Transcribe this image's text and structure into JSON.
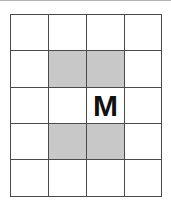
{
  "diagram": {
    "rows": 5,
    "cols": 4,
    "colors": {
      "line": "#4a4a4a",
      "shade": "#c8c8c8",
      "background": "#ffffff",
      "label": "#111111",
      "top_rule": "#b0b0b0"
    },
    "cells": [
      [
        {
          "label": "",
          "shaded": false
        },
        {
          "label": "",
          "shaded": false
        },
        {
          "label": "",
          "shaded": false
        },
        {
          "label": "",
          "shaded": false
        }
      ],
      [
        {
          "label": "",
          "shaded": false
        },
        {
          "label": "",
          "shaded": true
        },
        {
          "label": "",
          "shaded": true
        },
        {
          "label": "",
          "shaded": false
        }
      ],
      [
        {
          "label": "",
          "shaded": false
        },
        {
          "label": "",
          "shaded": false
        },
        {
          "label": "M",
          "shaded": false
        },
        {
          "label": "",
          "shaded": false
        }
      ],
      [
        {
          "label": "",
          "shaded": false
        },
        {
          "label": "",
          "shaded": true
        },
        {
          "label": "",
          "shaded": true
        },
        {
          "label": "",
          "shaded": false
        }
      ],
      [
        {
          "label": "",
          "shaded": false
        },
        {
          "label": "",
          "shaded": false
        },
        {
          "label": "",
          "shaded": false
        },
        {
          "label": "",
          "shaded": false
        }
      ]
    ]
  }
}
